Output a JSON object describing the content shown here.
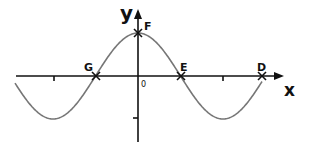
{
  "diagram": {
    "type": "cosine-graph",
    "axes": {
      "x_label": "x",
      "y_label": "y",
      "origin_label": "0"
    },
    "points": [
      {
        "name": "F",
        "description": "y-intercept / maximum"
      },
      {
        "name": "G",
        "description": "x-intercept left of origin"
      },
      {
        "name": "E",
        "description": "x-intercept right of origin"
      },
      {
        "name": "D",
        "description": "x-intercept far right"
      }
    ],
    "ticks": {
      "x": [
        "",
        ""
      ],
      "y": [
        ""
      ]
    },
    "colors": {
      "axis": "#111111",
      "curve": "#777777",
      "background": "#ffffff"
    }
  }
}
